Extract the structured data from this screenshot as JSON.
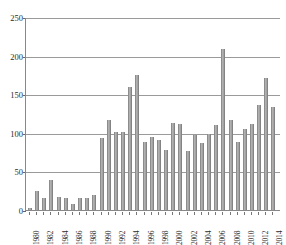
{
  "chart_data": {
    "type": "bar",
    "title": "",
    "subtitle": "",
    "xlabel": "",
    "ylabel": "",
    "ylim": [
      0,
      250
    ],
    "ytick_values": [
      0,
      50,
      100,
      150,
      200,
      250
    ],
    "ytick_labels": [
      "0",
      "50",
      "100",
      "150",
      "200",
      "250"
    ],
    "grid": true,
    "legend": false,
    "legend_position": "none",
    "xtick_interval": 2,
    "categories": [
      "1980",
      "1981",
      "1982",
      "1983",
      "1984",
      "1985",
      "1986",
      "1987",
      "1988",
      "1989",
      "1990",
      "1991",
      "1992",
      "1993",
      "1994",
      "1995",
      "1996",
      "1997",
      "1998",
      "1999",
      "2000",
      "2001",
      "2002",
      "2003",
      "2004",
      "2005",
      "2006",
      "2007",
      "2008",
      "2009",
      "2010",
      "2011",
      "2012",
      "2013",
      "2014"
    ],
    "xtick_labels": [
      "1980",
      "",
      "1982",
      "",
      "1984",
      "",
      "1986",
      "",
      "1988",
      "",
      "1990",
      "",
      "1992",
      "",
      "1994",
      "",
      "1996",
      "",
      "1998",
      "",
      "2000",
      "",
      "2002",
      "",
      "2004",
      "",
      "2006",
      "",
      "2008",
      "",
      "2010",
      "",
      "2012",
      "",
      "2014"
    ],
    "values": [
      3,
      25,
      16,
      39,
      17,
      16,
      8,
      15,
      16,
      20,
      93,
      117,
      101,
      101,
      159,
      175,
      88,
      95,
      91,
      78,
      113,
      111,
      77,
      97,
      87,
      98,
      110,
      208,
      117,
      88,
      105,
      111,
      136,
      171,
      134
    ],
    "values_tail": [
      87
    ],
    "bar_color": "#8c8c8c",
    "bar_highlight_color": "#bdbdbd",
    "grid_color": "#9a9a9a",
    "axis_color": "#888888",
    "background_color": "#ffffff",
    "text_color": "#2b2b2b"
  },
  "axes": {
    "y_axis_name": "y-axis",
    "x_axis_name": "x-axis"
  }
}
